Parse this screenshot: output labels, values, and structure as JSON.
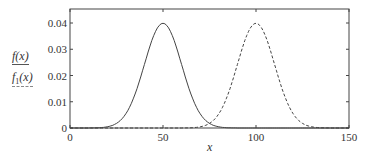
{
  "chart_data": {
    "type": "line",
    "title": "",
    "xlabel": "x",
    "ylabel": "",
    "xlim": [
      0,
      150
    ],
    "ylim": [
      0,
      0.045
    ],
    "x_ticks": [
      0,
      50,
      100,
      150
    ],
    "y_ticks": [
      0,
      0.01,
      0.02,
      0.03,
      0.04
    ],
    "y_tick_labels": [
      "0",
      "0.01",
      "0.02",
      "0.03",
      "0.04"
    ],
    "grid": false,
    "legend_position": "left of y-axis",
    "series": [
      {
        "name": "f(x)",
        "style": "solid",
        "distribution": "normal",
        "mean": 50,
        "sd": 10,
        "x": [
          0,
          10,
          20,
          30,
          40,
          50,
          60,
          70,
          80,
          90,
          100,
          110,
          120,
          130,
          140,
          150
        ],
        "values": [
          0.0,
          0.0,
          0.0004,
          0.0054,
          0.0242,
          0.0399,
          0.0242,
          0.0054,
          0.0004,
          0.0,
          0.0,
          0.0,
          0.0,
          0.0,
          0.0,
          0.0
        ]
      },
      {
        "name": "f1(x)",
        "style": "dashed",
        "distribution": "normal",
        "mean": 100,
        "sd": 10,
        "x": [
          0,
          10,
          20,
          30,
          40,
          50,
          60,
          70,
          80,
          90,
          100,
          110,
          120,
          130,
          140,
          150
        ],
        "values": [
          0.0,
          0.0,
          0.0,
          0.0,
          0.0,
          0.0,
          0.0,
          0.0004,
          0.0054,
          0.0242,
          0.0399,
          0.0242,
          0.0054,
          0.0004,
          0.0,
          0.0
        ]
      }
    ]
  },
  "legend": {
    "item1": "f(x)",
    "item2_base": "f",
    "item2_sub": "1",
    "item2_tail": "(x)"
  }
}
